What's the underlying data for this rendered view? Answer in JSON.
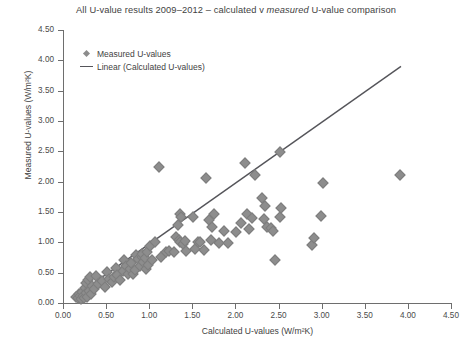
{
  "chart_data": {
    "type": "scatter",
    "title": "All U-value results 2009–2012 – calculated v measured U-value comparison",
    "title_plain_1": "All U-value results 2009–2012 – calculated v ",
    "title_italic": "measured",
    "title_plain_2": " U-value comparison",
    "xlabel": "Calculated U-values (W/m²K)",
    "ylabel": "Measured U-values (W/m²K)",
    "xlim": [
      0.0,
      4.5
    ],
    "ylim": [
      0.0,
      4.5
    ],
    "xticks": [
      "0.00",
      "0.50",
      "1.00",
      "1.50",
      "2.00",
      "2.50",
      "3.00",
      "3.50",
      "4.00",
      "4.50"
    ],
    "yticks": [
      "0.00",
      "0.50",
      "1.00",
      "1.50",
      "2.00",
      "2.50",
      "3.00",
      "3.50",
      "4.00",
      "4.50"
    ],
    "xtick_values": [
      0.0,
      0.5,
      1.0,
      1.5,
      2.0,
      2.5,
      3.0,
      3.5,
      4.0,
      4.5
    ],
    "ytick_values": [
      0.0,
      0.5,
      1.0,
      1.5,
      2.0,
      2.5,
      3.0,
      3.5,
      4.0,
      4.5
    ],
    "grid": false,
    "legend_position": "top-left-inside",
    "marker_color": "#8d8d8d",
    "line_color": "#55555a",
    "axis_color": "#6e6e6e",
    "legend": [
      {
        "label": "Measured U-values",
        "marker": "diamond"
      },
      {
        "label": "Linear (Calculated U-values)",
        "marker": "line"
      }
    ],
    "series": [
      {
        "name": "Measured U-values",
        "marker": "diamond",
        "points": [
          [
            0.14,
            0.12
          ],
          [
            0.16,
            0.1
          ],
          [
            0.17,
            0.17
          ],
          [
            0.19,
            0.13
          ],
          [
            0.2,
            0.08
          ],
          [
            0.21,
            0.2
          ],
          [
            0.22,
            0.14
          ],
          [
            0.23,
            0.1
          ],
          [
            0.24,
            0.26
          ],
          [
            0.25,
            0.18
          ],
          [
            0.26,
            0.34
          ],
          [
            0.27,
            0.12
          ],
          [
            0.28,
            0.4
          ],
          [
            0.29,
            0.22
          ],
          [
            0.3,
            0.44
          ],
          [
            0.31,
            0.16
          ],
          [
            0.33,
            0.3
          ],
          [
            0.35,
            0.24
          ],
          [
            0.37,
            0.46
          ],
          [
            0.4,
            0.33
          ],
          [
            0.44,
            0.38
          ],
          [
            0.47,
            0.28
          ],
          [
            0.5,
            0.52
          ],
          [
            0.52,
            0.41
          ],
          [
            0.56,
            0.36
          ],
          [
            0.58,
            0.44
          ],
          [
            0.6,
            0.6
          ],
          [
            0.62,
            0.47
          ],
          [
            0.65,
            0.39
          ],
          [
            0.68,
            0.55
          ],
          [
            0.7,
            0.72
          ],
          [
            0.72,
            0.63
          ],
          [
            0.74,
            0.5
          ],
          [
            0.76,
            0.58
          ],
          [
            0.78,
            0.68
          ],
          [
            0.8,
            0.49
          ],
          [
            0.82,
            0.56
          ],
          [
            0.84,
            0.8
          ],
          [
            0.86,
            0.74
          ],
          [
            0.88,
            0.63
          ],
          [
            0.9,
            0.78
          ],
          [
            0.9,
            0.83
          ],
          [
            0.92,
            0.7
          ],
          [
            0.94,
            0.76
          ],
          [
            0.95,
            0.58
          ],
          [
            0.96,
            0.86
          ],
          [
            0.98,
            0.64
          ],
          [
            1.0,
            0.95
          ],
          [
            1.02,
            0.72
          ],
          [
            1.05,
            1.02
          ],
          [
            1.1,
            2.26
          ],
          [
            1.12,
            0.78
          ],
          [
            1.18,
            0.85
          ],
          [
            1.22,
            0.88
          ],
          [
            1.28,
            0.86
          ],
          [
            1.3,
            1.1
          ],
          [
            1.32,
            1.3
          ],
          [
            1.33,
            1.06
          ],
          [
            1.34,
            1.02
          ],
          [
            1.35,
            1.48
          ],
          [
            1.36,
            1.44
          ],
          [
            1.38,
            0.99
          ],
          [
            1.4,
            1.04
          ],
          [
            1.42,
            0.88
          ],
          [
            1.5,
            1.44
          ],
          [
            1.52,
            0.9
          ],
          [
            1.55,
            1.02
          ],
          [
            1.58,
            1.03
          ],
          [
            1.62,
            0.89
          ],
          [
            1.65,
            2.07
          ],
          [
            1.68,
            1.38
          ],
          [
            1.7,
            1.05
          ],
          [
            1.72,
            1.27
          ],
          [
            1.74,
            1.49
          ],
          [
            1.8,
            1.0
          ],
          [
            1.85,
            1.21
          ],
          [
            1.9,
            1.0
          ],
          [
            2.0,
            1.18
          ],
          [
            2.05,
            1.33
          ],
          [
            2.1,
            2.32
          ],
          [
            2.12,
            1.48
          ],
          [
            2.15,
            1.23
          ],
          [
            2.18,
            1.42
          ],
          [
            2.22,
            2.13
          ],
          [
            2.3,
            1.75
          ],
          [
            2.32,
            1.4
          ],
          [
            2.33,
            1.62
          ],
          [
            2.35,
            1.27
          ],
          [
            2.4,
            1.25
          ],
          [
            2.42,
            1.2
          ],
          [
            2.45,
            0.73
          ],
          [
            2.5,
            2.5
          ],
          [
            2.5,
            1.43
          ],
          [
            2.52,
            1.58
          ],
          [
            2.88,
            0.98
          ],
          [
            2.9,
            1.08
          ],
          [
            2.98,
            1.45
          ],
          [
            3.0,
            2.0
          ],
          [
            3.9,
            2.13
          ]
        ]
      }
    ],
    "trendline": {
      "name": "Linear (Calculated U-values)",
      "x0": 0.11,
      "y0": 0.08,
      "x1": 3.92,
      "y1": 3.9
    }
  }
}
